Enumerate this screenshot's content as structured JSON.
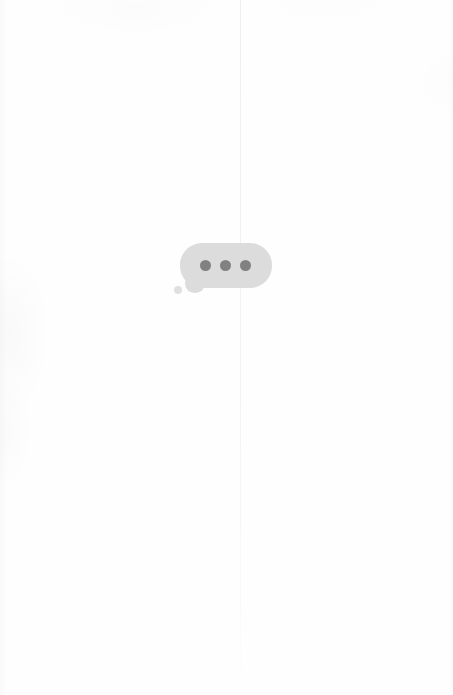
{
  "canvas": {
    "width": 453,
    "height": 695,
    "background_color": "#fefefe",
    "description": "Blank near-white page with a single centered chat typing indicator"
  },
  "fold_line": {
    "present": true,
    "orientation": "vertical",
    "x": 240,
    "color": "#f2f2f2",
    "note": "faint vertical crease fading toward the bottom"
  },
  "typing_indicator": {
    "label": "Typing indicator",
    "bubble": {
      "shape": "rounded-rectangle",
      "fill_color": "#dcdcdc",
      "x": 180,
      "y": 243,
      "width": 92,
      "height": 45,
      "corner_radius": 22
    },
    "tail": {
      "shape": "rounded-bump",
      "fill_color": "#dcdcdc"
    },
    "tail_dot": {
      "shape": "circle",
      "fill_color": "#e0e0e0",
      "diameter": 8
    },
    "dots": [
      {
        "name": "dot-1",
        "color": "#818181",
        "diameter": 11,
        "cx": 206,
        "cy": 266
      },
      {
        "name": "dot-2",
        "color": "#818181",
        "diameter": 11,
        "cx": 226,
        "cy": 266
      },
      {
        "name": "dot-3",
        "color": "#818181",
        "diameter": 11,
        "cx": 246,
        "cy": 266
      }
    ],
    "dot_count": 3,
    "status_text": ""
  }
}
